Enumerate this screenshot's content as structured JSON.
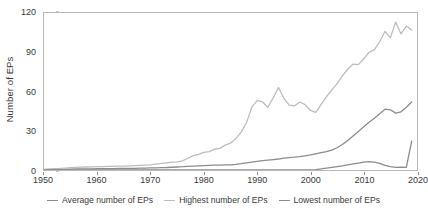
{
  "chart_data": {
    "type": "line",
    "title": "",
    "xlabel": "",
    "ylabel": "Number of EPs",
    "xlim": [
      1950,
      2020
    ],
    "ylim": [
      0,
      120
    ],
    "grid": false,
    "legend_position": "bottom",
    "x_ticks": [
      "1950",
      "1960",
      "1970",
      "1980",
      "1990",
      "2000",
      "2010",
      "2020"
    ],
    "x_tick_values": [
      1950,
      1960,
      1970,
      1980,
      1990,
      2000,
      2010,
      2020
    ],
    "y_ticks": [
      "0",
      "30",
      "60",
      "90",
      "120"
    ],
    "y_tick_values": [
      0,
      30,
      60,
      90,
      120
    ],
    "x": [
      1950,
      1951,
      1952,
      1953,
      1954,
      1955,
      1956,
      1957,
      1958,
      1959,
      1960,
      1961,
      1962,
      1963,
      1964,
      1965,
      1966,
      1967,
      1968,
      1969,
      1970,
      1971,
      1972,
      1973,
      1974,
      1975,
      1976,
      1977,
      1978,
      1979,
      1980,
      1981,
      1982,
      1983,
      1984,
      1985,
      1986,
      1987,
      1988,
      1989,
      1990,
      1991,
      1992,
      1993,
      1994,
      1995,
      1996,
      1997,
      1998,
      1999,
      2000,
      2001,
      2002,
      2003,
      2004,
      2005,
      2006,
      2007,
      2008,
      2009,
      2010,
      2011,
      2012,
      2013,
      2014,
      2015,
      2016,
      2017,
      2018,
      2019
    ],
    "series": [
      {
        "name": "Average number of EPs",
        "color": "#8c8c8c",
        "values": [
          0.2,
          0.3,
          0.4,
          0.5,
          0.6,
          0.7,
          0.8,
          0.8,
          0.9,
          0.9,
          1.0,
          1.0,
          1.1,
          1.1,
          1.2,
          1.2,
          1.3,
          1.3,
          1.4,
          1.5,
          1.6,
          1.7,
          1.8,
          1.9,
          2.1,
          2.3,
          2.5,
          2.8,
          3.0,
          3.2,
          3.4,
          3.6,
          3.7,
          3.8,
          3.9,
          4.0,
          4.3,
          4.8,
          5.4,
          6.0,
          6.6,
          7.1,
          7.6,
          8.0,
          8.4,
          9.0,
          9.5,
          9.8,
          10.2,
          10.8,
          11.5,
          12.4,
          13.2,
          14.0,
          15.2,
          17.0,
          19.5,
          22.5,
          26.0,
          29.5,
          33.0,
          36.5,
          39.5,
          43.0,
          46.5,
          46.0,
          43.5,
          44.5,
          48.0,
          52.0
        ]
      },
      {
        "name": "Highest number of EPs",
        "color": "#bdbdbd",
        "values": [
          0.5,
          0.8,
          1.0,
          1.2,
          1.5,
          1.8,
          2.0,
          2.2,
          2.3,
          2.4,
          2.5,
          2.6,
          2.7,
          2.8,
          2.9,
          3.0,
          3.2,
          3.4,
          3.6,
          3.8,
          4.0,
          4.5,
          5.0,
          5.5,
          6.0,
          6.2,
          7.0,
          9.0,
          11.0,
          12.0,
          13.5,
          14.0,
          16.0,
          16.5,
          19.0,
          20.5,
          24.0,
          29.0,
          36.0,
          48.0,
          53.0,
          52.0,
          48.0,
          55.0,
          63.0,
          55.0,
          49.5,
          49.0,
          52.0,
          50.0,
          45.5,
          44.0,
          50.0,
          56.0,
          61.0,
          66.0,
          72.0,
          77.0,
          81.0,
          80.5,
          85.0,
          90.0,
          92.0,
          98.0,
          106.0,
          101.0,
          113.0,
          104.0,
          110.0,
          107.0
        ]
      },
      {
        "name": "Lowest number of EPs",
        "color": "#8c8c8c",
        "values": [
          0.0,
          0.0,
          0.0,
          0.0,
          0.0,
          0.0,
          0.0,
          0.0,
          0.0,
          0.0,
          0.0,
          0.0,
          0.0,
          0.0,
          0.0,
          0.0,
          0.0,
          0.0,
          0.0,
          0.0,
          0.0,
          0.0,
          0.0,
          0.0,
          0.0,
          0.0,
          0.0,
          0.0,
          0.0,
          0.0,
          0.0,
          0.0,
          0.0,
          0.0,
          0.0,
          0.0,
          0.0,
          0.0,
          0.0,
          0.0,
          0.0,
          0.0,
          0.0,
          0.0,
          0.0,
          0.0,
          0.0,
          0.0,
          0.0,
          0.0,
          0.0,
          0.3,
          0.8,
          1.4,
          2.0,
          2.6,
          3.2,
          4.0,
          4.6,
          5.2,
          6.0,
          6.4,
          6.0,
          5.0,
          3.6,
          2.6,
          2.0,
          2.2,
          2.0,
          22.0
        ]
      }
    ]
  },
  "legend": {
    "items": [
      {
        "label": "Average number of EPs",
        "color": "#8c8c8c"
      },
      {
        "label": "Highest number of EPs",
        "color": "#bdbdbd"
      },
      {
        "label": "Lowest number of EPs",
        "color": "#8c8c8c"
      }
    ]
  }
}
